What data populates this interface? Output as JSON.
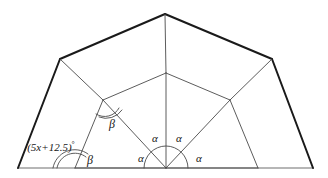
{
  "figure": {
    "colors": {
      "outline": "#1a1a1a",
      "inner_line": "#4a4a4a",
      "baseline": "#6e6e6e",
      "arc": "#4a4a4a",
      "text": "#151515",
      "background": "#ffffff"
    },
    "stroke_widths": {
      "outer": 2.0,
      "inner": 0.9,
      "baseline": 1.1,
      "arc": 0.9
    },
    "geometry": {
      "base_left": [
        18,
        168
      ],
      "base_right": [
        313,
        168
      ],
      "outer_left": [
        60,
        59
      ],
      "outer_right": [
        272,
        59
      ],
      "apex_top": [
        165,
        14
      ],
      "inner_left": [
        103,
        100
      ],
      "inner_right": [
        230,
        100
      ],
      "inner_top": [
        166,
        73
      ],
      "center": [
        166,
        168
      ],
      "base_tick_left": [
        75,
        168
      ],
      "base_tick_right": [
        258,
        168
      ]
    },
    "labels": {
      "alpha_upper_left": "α",
      "alpha_upper_right": "α",
      "alpha_lower_left": "α",
      "alpha_lower_right": "α",
      "beta_upper": "β",
      "beta_lower": "β",
      "angle_expression": "(5x+12.5)",
      "degree_symbol": "°"
    },
    "label_positions": {
      "alpha_upper_left": [
        155,
        138
      ],
      "alpha_upper_right": [
        179,
        138
      ],
      "alpha_lower_left": [
        141,
        158
      ],
      "alpha_lower_right": [
        199,
        158
      ],
      "beta_upper": [
        112,
        124
      ],
      "beta_lower": [
        90,
        160
      ],
      "angle_expression": [
        51,
        147
      ]
    }
  }
}
